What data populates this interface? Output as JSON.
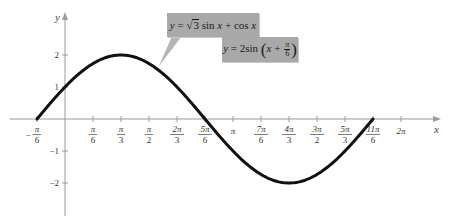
{
  "chart_data": {
    "type": "line",
    "title": "",
    "xlabel": "x",
    "ylabel": "y",
    "function": "y = 2 sin(x + pi/6)",
    "equivalent_form": "y = sqrt(3) sin x + cos x",
    "domain": [
      "-pi/6",
      "11pi/6"
    ],
    "xlim": [
      -0.62,
      6.9
    ],
    "ylim": [
      -3.0,
      3.3
    ],
    "grid": false,
    "x_tick_labels": [
      "-π/6",
      "π/6",
      "π/3",
      "π/2",
      "2π/3",
      "5π/6",
      "π",
      "7π/6",
      "4π/3",
      "3π/2",
      "5π/3",
      "11π/6",
      "2π"
    ],
    "x_tick_values": [
      -0.5236,
      0.5236,
      1.0472,
      1.5708,
      2.0944,
      2.618,
      3.1416,
      3.6652,
      4.1888,
      4.7124,
      5.236,
      5.7596,
      6.2832
    ],
    "y_tick_labels": [
      "2",
      "1",
      "-1",
      "-2"
    ],
    "y_tick_values": [
      2,
      1,
      -1,
      -2
    ],
    "series": [
      {
        "name": "y = 2 sin(x + π/6)",
        "x": [
          -0.5236,
          0,
          0.5236,
          1.0472,
          1.5708,
          2.0944,
          2.618,
          3.1416,
          3.6652,
          4.1888,
          4.7124,
          5.236,
          5.7596
        ],
        "values": [
          0,
          1,
          1.732,
          2,
          1.732,
          1,
          0,
          -1,
          -1.732,
          -2,
          -1.732,
          -1,
          0
        ]
      }
    ],
    "annotations": [
      {
        "text": "y = √3 sin x + cos x",
        "position": "callout top"
      },
      {
        "text": "y = 2 sin (x + π/6)",
        "position": "callout below"
      }
    ],
    "key_points": {
      "max": {
        "x": "π/3",
        "y": 2
      },
      "min": {
        "x": "4π/3",
        "y": -2
      },
      "zeros": [
        "-π/6",
        "5π/6",
        "11π/6"
      ],
      "y_intercept": 1
    }
  },
  "callouts": {
    "first": {
      "lhs": "y",
      "eq": " = ",
      "sqrt_arg": "3",
      "rest_a": " sin ",
      "var_a": "x",
      "rest_b": " + cos ",
      "var_b": "x"
    },
    "second": {
      "lhs": "y",
      "eq": " = 2sin ",
      "var": "x",
      "plus": " + ",
      "frac_num": "π",
      "frac_den": "6"
    }
  },
  "colors": {
    "curve": "#111111",
    "axis": "#9a9a9a",
    "callout_bg": "#a9a9a9"
  }
}
